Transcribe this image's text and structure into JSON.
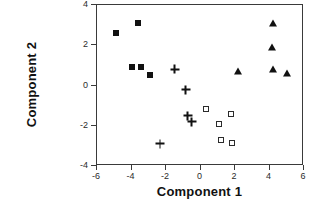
{
  "chart_data": {
    "type": "scatter",
    "title": "",
    "xlabel": "Component  1",
    "ylabel": "Component  2",
    "xlim": [
      -6,
      6
    ],
    "ylim": [
      -4,
      4
    ],
    "xticks": [
      -6,
      -4,
      -2,
      0,
      2,
      4,
      6
    ],
    "yticks": [
      -4,
      -2,
      0,
      2,
      4
    ],
    "xticklabels": [
      "-6",
      "-4",
      "-2",
      "0",
      "2",
      "4",
      "6"
    ],
    "yticklabels": [
      "-4",
      "-2",
      "0",
      "2",
      "4"
    ],
    "grid": false,
    "legend": "none",
    "series": [
      {
        "name": "filled-square-group",
        "marker": "filled-square",
        "color": "#111111",
        "points": [
          {
            "x": -4.9,
            "y": 2.6
          },
          {
            "x": -3.6,
            "y": 3.1
          },
          {
            "x": -4.0,
            "y": 0.9
          },
          {
            "x": -3.45,
            "y": 0.9
          },
          {
            "x": -2.9,
            "y": 0.5
          }
        ]
      },
      {
        "name": "plus-group",
        "marker": "plus",
        "color": "#111111",
        "points": [
          {
            "x": -1.5,
            "y": 0.8
          },
          {
            "x": -0.85,
            "y": -0.2
          },
          {
            "x": -0.75,
            "y": -1.5
          },
          {
            "x": -0.5,
            "y": -1.8
          },
          {
            "x": -2.35,
            "y": -2.9
          }
        ]
      },
      {
        "name": "open-square-group",
        "marker": "open-square",
        "color": "#2b2b2b",
        "points": [
          {
            "x": 0.3,
            "y": -1.15
          },
          {
            "x": 1.75,
            "y": -1.4
          },
          {
            "x": 1.05,
            "y": -1.9
          },
          {
            "x": 1.2,
            "y": -2.7
          },
          {
            "x": 1.8,
            "y": -2.85
          }
        ]
      },
      {
        "name": "filled-triangle-group",
        "marker": "filled-triangle",
        "color": "#111111",
        "points": [
          {
            "x": 4.2,
            "y": 3.1
          },
          {
            "x": 4.15,
            "y": 1.9
          },
          {
            "x": 2.15,
            "y": 0.7
          },
          {
            "x": 4.2,
            "y": 0.8
          },
          {
            "x": 5.0,
            "y": 0.6
          }
        ]
      }
    ]
  }
}
